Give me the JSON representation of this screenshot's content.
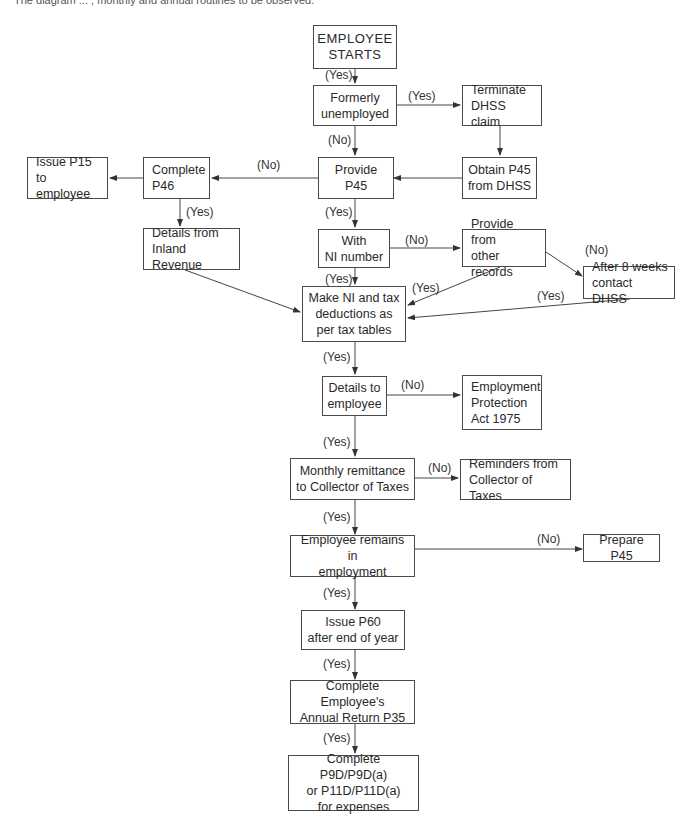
{
  "caption": "The diagram ... , monthly and annual routines to be observed.",
  "nodes": {
    "start": [
      "EMPLOYEE",
      "STARTS"
    ],
    "formerly_unemployed": [
      "Formerly",
      "unemployed"
    ],
    "terminate_dhss": [
      "Terminate",
      "DHSS claim"
    ],
    "provide_p45": [
      "Provide",
      "P45"
    ],
    "obtain_p45": [
      "Obtain P45",
      "from DHSS"
    ],
    "complete_p46": [
      "Complete",
      "P46"
    ],
    "issue_p15": [
      "Issue P15",
      "to employee"
    ],
    "details_inland": [
      "Details from",
      "Inland Revenue"
    ],
    "with_ni": [
      "With",
      "NI number"
    ],
    "provide_records": [
      "Provide from",
      "other records"
    ],
    "after_8_weeks": [
      "After 8 weeks",
      "contact DHSS"
    ],
    "make_ni": [
      "Make NI and tax",
      "deductions as",
      "per tax tables"
    ],
    "details_employee": [
      "Details to",
      "employee"
    ],
    "employment_protection": [
      "Employment",
      "Protection",
      "Act 1975"
    ],
    "monthly_remittance": [
      "Monthly remittance",
      "to Collector of Taxes"
    ],
    "reminders": [
      "Reminders from",
      "Collector of Taxes"
    ],
    "remains": [
      "Employee remains in",
      "employment"
    ],
    "prepare_p45": [
      "Prepare P45"
    ],
    "issue_p60": [
      "Issue P60",
      "after end of year"
    ],
    "annual_return": [
      "Complete Employee's",
      "Annual Return P35"
    ],
    "complete_p9d": [
      "Complete P9D/P9D(a)",
      "or P11D/P11D(a)",
      "for expenses"
    ]
  },
  "labels": {
    "yes": "(Yes)",
    "no": "(No)"
  }
}
